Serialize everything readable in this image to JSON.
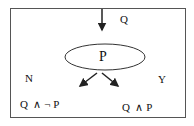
{
  "diagram": {
    "input_label": "Q",
    "node_label": "P",
    "branch_no_label": "N",
    "branch_yes_label": "Y",
    "outcome_no": "Q  ∧ ¬ P",
    "outcome_yes": "Q  ∧ P",
    "colors": {
      "stroke": "#333333",
      "text": "#111111",
      "background": "#ffffff"
    }
  }
}
